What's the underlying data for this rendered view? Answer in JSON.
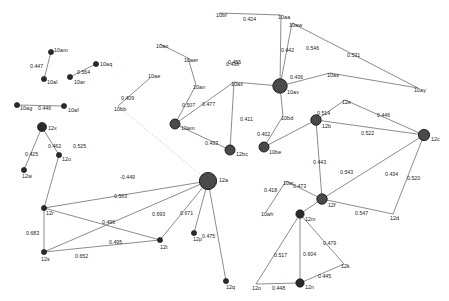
{
  "figure": {
    "type": "network-graph",
    "width": 449,
    "height": 301,
    "background": "#ffffff",
    "edge_color": "#555a60",
    "dashed_edge_color": "#b9bcc0",
    "node_color": "#2b2b2b",
    "hub_node_color": "#4a4a4a"
  },
  "nodes": [
    {
      "id": "10am",
      "label": "10am",
      "x": 51,
      "y": 52,
      "r": 2.6,
      "label_dx": 4,
      "label_dy": -2
    },
    {
      "id": "10al",
      "label": "10al",
      "x": 44,
      "y": 79,
      "r": 2.6,
      "label_dx": 4,
      "label_dy": 2
    },
    {
      "id": "10ar",
      "label": "10ar",
      "x": 70,
      "y": 77,
      "r": 2.6,
      "label_dx": 4,
      "label_dy": 3
    },
    {
      "id": "10aq",
      "label": "10aq",
      "x": 96,
      "y": 64,
      "r": 2.6,
      "label_dx": 4,
      "label_dy": -1
    },
    {
      "id": "10ag",
      "label": "10ag",
      "x": 17,
      "y": 105,
      "r": 2.6,
      "label_dx": 2,
      "label_dy": 3
    },
    {
      "id": "10af",
      "label": "10af",
      "x": 64,
      "y": 106,
      "r": 2.6,
      "label_dx": 4,
      "label_dy": 2
    },
    {
      "id": "12x",
      "label": "12x",
      "x": 42,
      "y": 127,
      "r": 4.6,
      "label_dx": 6,
      "label_dy": 0
    },
    {
      "id": "12u",
      "label": "12u",
      "x": 59,
      "y": 155,
      "r": 2.6,
      "label_dx": 3,
      "label_dy": 2
    },
    {
      "id": "12w",
      "label": "12w",
      "x": 24,
      "y": 170,
      "r": 2.6,
      "label_dx": -1,
      "label_dy": 3
    },
    {
      "id": "12r",
      "label": "12r",
      "x": 44,
      "y": 208,
      "r": 2.6,
      "label_dx": 2,
      "label_dy": 3
    },
    {
      "id": "12s",
      "label": "12s",
      "x": 44,
      "y": 252,
      "r": 2.6,
      "label_dx": 0,
      "label_dy": 4
    },
    {
      "id": "12t",
      "label": "12t",
      "x": 160,
      "y": 240,
      "r": 2.6,
      "label_dx": 2,
      "label_dy": 4
    },
    {
      "id": "12a",
      "label": "12a",
      "x": 208,
      "y": 181,
      "r": 8.6,
      "label_dx": 10,
      "label_dy": 0
    },
    {
      "id": "12p",
      "label": "12p",
      "x": 194,
      "y": 233,
      "r": 2.6,
      "label_dx": 2,
      "label_dy": 4
    },
    {
      "id": "12q",
      "label": "12q",
      "x": 226,
      "y": 281,
      "r": 2.6,
      "label_dx": 2,
      "label_dy": 4
    },
    {
      "id": "10bb",
      "label": "10bb",
      "x": 118,
      "y": 106,
      "r": 0,
      "label_dx": 0,
      "label_dy": 0
    },
    {
      "id": "10ae",
      "label": "10ae",
      "x": 150,
      "y": 78,
      "r": 0,
      "label_dx": 0,
      "label_dy": 0
    },
    {
      "id": "10am2",
      "label": "10am",
      "x": 175,
      "y": 124,
      "r": 5.0,
      "label_dx": 6,
      "label_dy": 3
    },
    {
      "id": "12bc",
      "label": "12bc",
      "x": 230,
      "y": 150,
      "r": 5.0,
      "label_dx": 6,
      "label_dy": 3
    },
    {
      "id": "10av",
      "label": "10av",
      "x": 280,
      "y": 86,
      "r": 7.2,
      "label_dx": 8,
      "label_dy": 4
    },
    {
      "id": "10bd",
      "label": "10bd",
      "x": 283,
      "y": 116,
      "r": 0,
      "label_dx": 0,
      "label_dy": 0
    },
    {
      "id": "10be",
      "label": "10be",
      "x": 264,
      "y": 147,
      "r": 5.0,
      "label_dx": 5,
      "label_dy": 4
    },
    {
      "id": "12b",
      "label": "12b",
      "x": 316,
      "y": 120,
      "r": 5.2,
      "label_dx": 6,
      "label_dy": 4
    },
    {
      "id": "12c",
      "label": "12c",
      "x": 424,
      "y": 135,
      "r": 5.6,
      "label_dx": 7,
      "label_dy": 3
    },
    {
      "id": "12e",
      "label": "12e",
      "x": 345,
      "y": 100,
      "r": 0,
      "label_dx": 0,
      "label_dy": 0
    },
    {
      "id": "12f",
      "label": "12f",
      "x": 322,
      "y": 199,
      "r": 5.2,
      "label_dx": 6,
      "label_dy": 4
    },
    {
      "id": "12d",
      "label": "12d",
      "x": 393,
      "y": 214,
      "r": 0,
      "label_dx": 0,
      "label_dy": 0
    },
    {
      "id": "12m",
      "label": "12m",
      "x": 300,
      "y": 214,
      "r": 4.2,
      "label_dx": 5,
      "label_dy": 4
    },
    {
      "id": "12n",
      "label": "12n",
      "x": 300,
      "y": 283,
      "r": 4.2,
      "label_dx": 5,
      "label_dy": 3
    },
    {
      "id": "12o",
      "label": "12o",
      "x": 256,
      "y": 284,
      "r": 0,
      "label_dx": 0,
      "label_dy": 0
    },
    {
      "id": "12k",
      "label": "12k",
      "x": 344,
      "y": 264,
      "r": 0,
      "label_dx": 0,
      "label_dy": 0
    },
    {
      "id": "10ah",
      "label": "10ah",
      "x": 266,
      "y": 212,
      "r": 0,
      "label_dx": 0,
      "label_dy": 0
    },
    {
      "id": "10ai",
      "label": "10ai",
      "x": 286,
      "y": 181,
      "r": 0,
      "label_dx": 0,
      "label_dy": 0
    },
    {
      "id": "10bf",
      "label": "10bf",
      "x": 219,
      "y": 13,
      "r": 0,
      "label_dx": 0,
      "label_dy": 0
    },
    {
      "id": "10ao",
      "label": "10ao",
      "x": 160,
      "y": 44,
      "r": 0,
      "label_dx": 0,
      "label_dy": 0
    },
    {
      "id": "10aer",
      "label": "10aer",
      "x": 188,
      "y": 58,
      "r": 0,
      "label_dx": 0,
      "label_dy": 0
    },
    {
      "id": "10an",
      "label": "10an",
      "x": 196,
      "y": 85,
      "r": 0,
      "label_dx": 0,
      "label_dy": 0
    },
    {
      "id": "10ax",
      "label": "10ax",
      "x": 234,
      "y": 82,
      "r": 0,
      "label_dx": 0,
      "label_dy": 0
    },
    {
      "id": "10aw",
      "label": "10aw",
      "x": 292,
      "y": 23,
      "r": 0,
      "label_dx": 0,
      "label_dy": 0
    },
    {
      "id": "10as",
      "label": "10as",
      "x": 330,
      "y": 73,
      "r": 0,
      "label_dx": 0,
      "label_dy": 0
    },
    {
      "id": "10ay",
      "label": "10ay",
      "x": 418,
      "y": 88,
      "r": 0,
      "label_dx": 0,
      "label_dy": 0
    },
    {
      "id": "10aa",
      "label": "10aa",
      "x": 281,
      "y": 15,
      "r": 0,
      "label_dx": 0,
      "label_dy": 0
    }
  ],
  "node_labels": [
    {
      "text": "10am",
      "x": 54,
      "y": 48
    },
    {
      "text": "10al",
      "x": 47,
      "y": 80
    },
    {
      "text": "10ar",
      "x": 74,
      "y": 80
    },
    {
      "text": "10aq",
      "x": 100,
      "y": 62
    },
    {
      "text": "10ag",
      "x": 20,
      "y": 106
    },
    {
      "text": "10af",
      "x": 68,
      "y": 108
    },
    {
      "text": "12x",
      "x": 48,
      "y": 126
    },
    {
      "text": "12u",
      "x": 62,
      "y": 157
    },
    {
      "text": "12w",
      "x": 22,
      "y": 174
    },
    {
      "text": "12r",
      "x": 46,
      "y": 211
    },
    {
      "text": "12s",
      "x": 41,
      "y": 257
    },
    {
      "text": "12t",
      "x": 160,
      "y": 245
    },
    {
      "text": "12a",
      "x": 219,
      "y": 178
    },
    {
      "text": "12p",
      "x": 193,
      "y": 237
    },
    {
      "text": "12q",
      "x": 226,
      "y": 285
    },
    {
      "text": "10bb",
      "x": 114,
      "y": 107
    },
    {
      "text": "10ae",
      "x": 148,
      "y": 74
    },
    {
      "text": "10am",
      "x": 181,
      "y": 126
    },
    {
      "text": "12bc",
      "x": 236,
      "y": 152
    },
    {
      "text": "10av",
      "x": 287,
      "y": 90
    },
    {
      "text": "10bd",
      "x": 281,
      "y": 116
    },
    {
      "text": "10be",
      "x": 269,
      "y": 150
    },
    {
      "text": "12b",
      "x": 322,
      "y": 124
    },
    {
      "text": "12c",
      "x": 431,
      "y": 137
    },
    {
      "text": "12e",
      "x": 342,
      "y": 100
    },
    {
      "text": "12f",
      "x": 328,
      "y": 203
    },
    {
      "text": "12d",
      "x": 390,
      "y": 216
    },
    {
      "text": "12m",
      "x": 305,
      "y": 217
    },
    {
      "text": "12n",
      "x": 305,
      "y": 285
    },
    {
      "text": "12o",
      "x": 252,
      "y": 286
    },
    {
      "text": "12k",
      "x": 341,
      "y": 264
    },
    {
      "text": "10ah",
      "x": 261,
      "y": 212
    },
    {
      "text": "10ai",
      "x": 283,
      "y": 181
    },
    {
      "text": "10bf",
      "x": 216,
      "y": 13
    },
    {
      "text": "10ao",
      "x": 156,
      "y": 44
    },
    {
      "text": "10aer",
      "x": 184,
      "y": 58
    },
    {
      "text": "10an",
      "x": 193,
      "y": 85
    },
    {
      "text": "10ax",
      "x": 231,
      "y": 82
    },
    {
      "text": "10aw",
      "x": 289,
      "y": 23
    },
    {
      "text": "10as",
      "x": 327,
      "y": 73
    },
    {
      "text": "10ay",
      "x": 414,
      "y": 88
    },
    {
      "text": "10aa",
      "x": 278,
      "y": 15
    }
  ],
  "edges": [
    {
      "from": "10am",
      "to": "10al",
      "weight": "0.447",
      "style": "solid"
    },
    {
      "from": "10ar",
      "to": "10aq",
      "weight": "0.564",
      "style": "solid"
    },
    {
      "from": "10ag",
      "to": "10af",
      "weight": "0.446",
      "style": "solid"
    },
    {
      "from": "12x",
      "to": "12w",
      "weight": "0.425",
      "style": "solid"
    },
    {
      "from": "12x",
      "to": "12u",
      "weight": "0.462",
      "style": "solid"
    },
    {
      "from": "12u",
      "to": "12r",
      "weight": "0.525",
      "style": "solid"
    },
    {
      "from": "12r",
      "to": "12s",
      "weight": "0.683",
      "style": "solid"
    },
    {
      "from": "12s",
      "to": "12t",
      "weight": "0.652",
      "style": "solid"
    },
    {
      "from": "12r",
      "to": "12t",
      "weight": "0.496",
      "style": "solid"
    },
    {
      "from": "12s",
      "to": "12a",
      "weight": "0.495",
      "style": "solid"
    },
    {
      "from": "12r",
      "to": "12a",
      "weight": "0.563",
      "style": "solid"
    },
    {
      "from": "12a",
      "to": "12t",
      "weight": "0.693",
      "style": "solid"
    },
    {
      "from": "12a",
      "to": "12p",
      "weight": "0.671",
      "style": "solid"
    },
    {
      "from": "12a",
      "to": "12q",
      "weight": "0.475",
      "style": "solid"
    },
    {
      "from": "10bb",
      "to": "12a",
      "weight": "-0.449",
      "style": "dashed"
    },
    {
      "from": "10bb",
      "to": "10ae",
      "weight": "0.409",
      "style": "solid"
    },
    {
      "from": "10ao",
      "to": "10aer",
      "weight": "",
      "style": "solid"
    },
    {
      "from": "10bf",
      "to": "10aa",
      "weight": "0.424",
      "style": "solid"
    },
    {
      "from": "10aer",
      "to": "10an",
      "weight": "0.438",
      "style": "solid"
    },
    {
      "from": "10am2",
      "to": "10an",
      "weight": "0.507",
      "style": "solid"
    },
    {
      "from": "10am2",
      "to": "10ax",
      "weight": "0.477",
      "style": "solid"
    },
    {
      "from": "10ax",
      "to": "12bc",
      "weight": "0.411",
      "style": "solid"
    },
    {
      "from": "10am2",
      "to": "12bc",
      "weight": "0.433",
      "style": "solid"
    },
    {
      "from": "10av",
      "to": "10ax",
      "weight": "0.455",
      "style": "solid"
    },
    {
      "from": "10av",
      "to": "10aa",
      "weight": "0.442",
      "style": "solid"
    },
    {
      "from": "10av",
      "to": "10aw",
      "weight": "0.546",
      "style": "solid"
    },
    {
      "from": "10aw",
      "to": "10ay",
      "weight": "0.531",
      "style": "solid"
    },
    {
      "from": "10av",
      "to": "10as",
      "weight": "0.436",
      "style": "solid"
    },
    {
      "from": "10as",
      "to": "10ay",
      "weight": "",
      "style": "solid"
    },
    {
      "from": "10av",
      "to": "10bd",
      "weight": "",
      "style": "solid"
    },
    {
      "from": "10bd",
      "to": "10be",
      "weight": "0.402",
      "style": "solid"
    },
    {
      "from": "10be",
      "to": "12b",
      "weight": "0.514",
      "style": "solid"
    },
    {
      "from": "12b",
      "to": "12e",
      "weight": "0.446",
      "style": "solid"
    },
    {
      "from": "12b",
      "to": "12c",
      "weight": "0.522",
      "style": "solid"
    },
    {
      "from": "12e",
      "to": "12c",
      "weight": "",
      "style": "solid"
    },
    {
      "from": "12b",
      "to": "12f",
      "weight": "0.443",
      "style": "solid"
    },
    {
      "from": "12f",
      "to": "12c",
      "weight": "0.434",
      "style": "solid"
    },
    {
      "from": "12c",
      "to": "12d",
      "weight": "0.520",
      "style": "solid"
    },
    {
      "from": "12f",
      "to": "12d",
      "weight": "0.547",
      "style": "solid"
    },
    {
      "from": "12m",
      "to": "12f",
      "weight": "0.543",
      "style": "solid"
    },
    {
      "from": "10ah",
      "to": "10ai",
      "weight": "0.418",
      "style": "solid"
    },
    {
      "from": "10ai",
      "to": "12f",
      "weight": "0.473",
      "style": "solid"
    },
    {
      "from": "12m",
      "to": "12o",
      "weight": "0.517",
      "style": "solid"
    },
    {
      "from": "12m",
      "to": "12n",
      "weight": "0.604",
      "style": "solid"
    },
    {
      "from": "12m",
      "to": "12k",
      "weight": "0.479",
      "style": "solid"
    },
    {
      "from": "12n",
      "to": "12k",
      "weight": "0.445",
      "style": "solid"
    },
    {
      "from": "12o",
      "to": "12n",
      "weight": "0.448",
      "style": "solid"
    }
  ],
  "edge_labels": [
    {
      "text": "0.447",
      "x": 30,
      "y": 64
    },
    {
      "text": "0.564",
      "x": 77,
      "y": 70
    },
    {
      "text": "0.446",
      "x": 38,
      "y": 106
    },
    {
      "text": "0.425",
      "x": 25,
      "y": 152
    },
    {
      "text": "0.462",
      "x": 48,
      "y": 144
    },
    {
      "text": "0.525",
      "x": 73,
      "y": 144
    },
    {
      "text": "0.683",
      "x": 26,
      "y": 231
    },
    {
      "text": "0.652",
      "x": 75,
      "y": 254
    },
    {
      "text": "0.496",
      "x": 102,
      "y": 220
    },
    {
      "text": "0.495",
      "x": 109,
      "y": 240
    },
    {
      "text": "0.563",
      "x": 114,
      "y": 194
    },
    {
      "text": "0.693",
      "x": 152,
      "y": 212
    },
    {
      "text": "0.671",
      "x": 180,
      "y": 211
    },
    {
      "text": "0.475",
      "x": 202,
      "y": 234
    },
    {
      "text": "-0.449",
      "x": 120,
      "y": 175
    },
    {
      "text": "0.409",
      "x": 121,
      "y": 96
    },
    {
      "text": "0.424",
      "x": 243,
      "y": 17
    },
    {
      "text": "0.438",
      "x": 226,
      "y": 62
    },
    {
      "text": "0.507",
      "x": 182,
      "y": 103
    },
    {
      "text": "0.477",
      "x": 202,
      "y": 102
    },
    {
      "text": "0.411",
      "x": 240,
      "y": 117
    },
    {
      "text": "0.433",
      "x": 205,
      "y": 141
    },
    {
      "text": "0.455",
      "x": 228,
      "y": 60
    },
    {
      "text": "0.442",
      "x": 281,
      "y": 48
    },
    {
      "text": "0.546",
      "x": 306,
      "y": 46
    },
    {
      "text": "0.531",
      "x": 347,
      "y": 53
    },
    {
      "text": "0.436",
      "x": 290,
      "y": 75
    },
    {
      "text": "0.402",
      "x": 257,
      "y": 132
    },
    {
      "text": "0.514",
      "x": 317,
      "y": 111
    },
    {
      "text": "0.446",
      "x": 377,
      "y": 113
    },
    {
      "text": "0.522",
      "x": 361,
      "y": 131
    },
    {
      "text": "0.443",
      "x": 313,
      "y": 160
    },
    {
      "text": "0.434",
      "x": 385,
      "y": 172
    },
    {
      "text": "0.520",
      "x": 407,
      "y": 176
    },
    {
      "text": "0.547",
      "x": 355,
      "y": 211
    },
    {
      "text": "0.543",
      "x": 340,
      "y": 170
    },
    {
      "text": "0.418",
      "x": 264,
      "y": 188
    },
    {
      "text": "0.473",
      "x": 293,
      "y": 184
    },
    {
      "text": "0.517",
      "x": 274,
      "y": 253
    },
    {
      "text": "0.604",
      "x": 303,
      "y": 252
    },
    {
      "text": "0.479",
      "x": 323,
      "y": 241
    },
    {
      "text": "0.445",
      "x": 318,
      "y": 274
    },
    {
      "text": "0.448",
      "x": 272,
      "y": 286
    }
  ]
}
